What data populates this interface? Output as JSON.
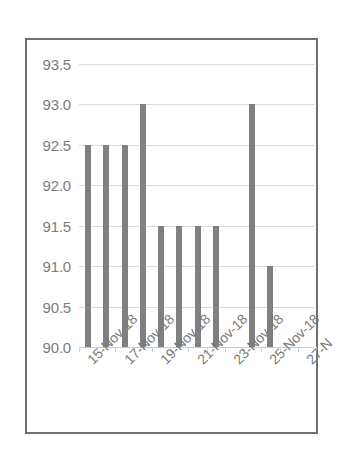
{
  "chart_data": {
    "type": "bar",
    "title": "",
    "subtitle": "",
    "xlabel": "",
    "ylabel": "",
    "ylim": [
      90.0,
      93.5
    ],
    "ytick_labels": [
      "93.5",
      "93.0",
      "92.5",
      "92.0",
      "91.5",
      "91.0",
      "90.5",
      "90.0"
    ],
    "ytick_values": [
      93.5,
      93.0,
      92.5,
      92.0,
      91.5,
      91.0,
      90.5,
      90.0
    ],
    "grid": true,
    "legend": false,
    "legend_position": "none",
    "bar_color": "#808080",
    "gridline_color": "#dcdcdc",
    "axis_text_color": "#7b7b7b",
    "border_color": "#6f6f6f",
    "background_color": "#ffffff",
    "categories": [
      "15-Nov-18",
      "16-Nov-18",
      "17-Nov-18",
      "18-Nov-18",
      "19-Nov-18",
      "20-Nov-18",
      "21-Nov-18",
      "22-Nov-18",
      "23-Nov-18",
      "24-Nov-18",
      "25-Nov-18",
      "26-Nov-18",
      "27-Nov-18"
    ],
    "values": [
      92.5,
      92.5,
      92.5,
      93.0,
      91.5,
      91.5,
      91.5,
      91.5,
      null,
      93.0,
      91.0,
      null,
      null
    ],
    "xtick_labels": [
      "15-Nov-18",
      "17-Nov-18",
      "19-Nov-18",
      "21-Nov-18",
      "23-Nov-18",
      "25-Nov-18",
      "27-N"
    ],
    "xtick_label_rotation": -45,
    "xtick_label_truncated_last": true
  }
}
